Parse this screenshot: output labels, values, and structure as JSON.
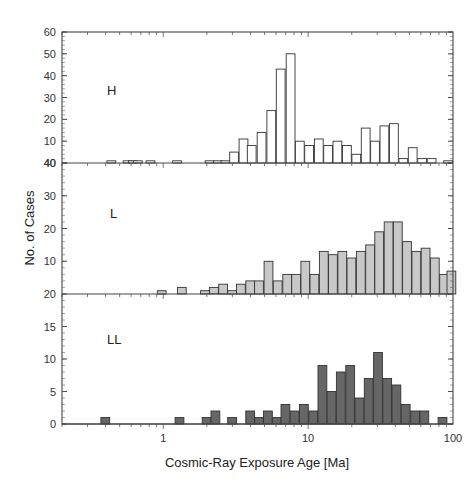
{
  "chart_data": {
    "type": "bar",
    "title": "",
    "xlabel": "Cosmic-Ray Exposure Age [Ma]",
    "ylabel": "No. of Cases",
    "xscale": "log",
    "xlim": [
      0.2,
      100
    ],
    "x_ticks": [
      {
        "value": 1,
        "label": "1"
      },
      {
        "value": 10,
        "label": "10"
      },
      {
        "value": 100,
        "label": "100"
      }
    ],
    "bin_width_log10": 0.065,
    "grid": false,
    "legend": null,
    "panels": [
      {
        "name": "H",
        "label": "H",
        "fill": "#ffffff",
        "ylim": [
          0,
          60
        ],
        "y_ticks": [
          {
            "value": 0,
            "label": "40"
          },
          {
            "value": 10,
            "label": "10"
          },
          {
            "value": 20,
            "label": "20"
          },
          {
            "value": 30,
            "label": "30"
          },
          {
            "value": 40,
            "label": "40"
          },
          {
            "value": 50,
            "label": "50"
          },
          {
            "value": 60,
            "label": "60"
          }
        ],
        "bins": [
          {
            "x": 0.44,
            "count": 1
          },
          {
            "x": 0.57,
            "count": 1
          },
          {
            "x": 0.62,
            "count": 1
          },
          {
            "x": 0.67,
            "count": 1
          },
          {
            "x": 0.82,
            "count": 1
          },
          {
            "x": 1.25,
            "count": 1
          },
          {
            "x": 2.1,
            "count": 1
          },
          {
            "x": 2.4,
            "count": 1
          },
          {
            "x": 2.7,
            "count": 1
          },
          {
            "x": 3.1,
            "count": 5
          },
          {
            "x": 3.6,
            "count": 11
          },
          {
            "x": 4.1,
            "count": 8
          },
          {
            "x": 4.8,
            "count": 14
          },
          {
            "x": 5.6,
            "count": 24
          },
          {
            "x": 6.5,
            "count": 43
          },
          {
            "x": 7.6,
            "count": 50
          },
          {
            "x": 8.8,
            "count": 10
          },
          {
            "x": 10.2,
            "count": 8
          },
          {
            "x": 11.9,
            "count": 11
          },
          {
            "x": 13.8,
            "count": 8
          },
          {
            "x": 16.0,
            "count": 10
          },
          {
            "x": 18.6,
            "count": 8
          },
          {
            "x": 21.6,
            "count": 4
          },
          {
            "x": 25.1,
            "count": 16
          },
          {
            "x": 29.1,
            "count": 10
          },
          {
            "x": 33.8,
            "count": 17
          },
          {
            "x": 39.3,
            "count": 18
          },
          {
            "x": 45.6,
            "count": 2
          },
          {
            "x": 53.0,
            "count": 7
          },
          {
            "x": 61.5,
            "count": 2
          },
          {
            "x": 71.5,
            "count": 2
          },
          {
            "x": 93.0,
            "count": 1
          }
        ]
      },
      {
        "name": "L",
        "label": "L",
        "fill": "#c8c8c8",
        "ylim": [
          0,
          40
        ],
        "y_ticks": [
          {
            "value": 0,
            "label": "20"
          },
          {
            "value": 10,
            "label": "10"
          },
          {
            "value": 20,
            "label": "20"
          },
          {
            "value": 30,
            "label": "30"
          },
          {
            "value": 40,
            "label": "40"
          }
        ],
        "bins": [
          {
            "x": 0.98,
            "count": 1
          },
          {
            "x": 1.35,
            "count": 2
          },
          {
            "x": 1.95,
            "count": 1
          },
          {
            "x": 2.25,
            "count": 2
          },
          {
            "x": 2.6,
            "count": 3
          },
          {
            "x": 3.0,
            "count": 1
          },
          {
            "x": 3.45,
            "count": 3
          },
          {
            "x": 4.0,
            "count": 4
          },
          {
            "x": 4.6,
            "count": 4
          },
          {
            "x": 5.35,
            "count": 10
          },
          {
            "x": 6.2,
            "count": 4
          },
          {
            "x": 7.2,
            "count": 6
          },
          {
            "x": 8.3,
            "count": 6
          },
          {
            "x": 9.6,
            "count": 10
          },
          {
            "x": 11.1,
            "count": 6
          },
          {
            "x": 12.9,
            "count": 13
          },
          {
            "x": 14.9,
            "count": 12
          },
          {
            "x": 17.3,
            "count": 13
          },
          {
            "x": 20.0,
            "count": 11
          },
          {
            "x": 23.2,
            "count": 13
          },
          {
            "x": 26.9,
            "count": 15
          },
          {
            "x": 31.1,
            "count": 19
          },
          {
            "x": 36.1,
            "count": 22
          },
          {
            "x": 41.8,
            "count": 22
          },
          {
            "x": 48.4,
            "count": 16
          },
          {
            "x": 56.1,
            "count": 13
          },
          {
            "x": 65.0,
            "count": 14
          },
          {
            "x": 75.3,
            "count": 11
          },
          {
            "x": 87.3,
            "count": 6
          },
          {
            "x": 98.0,
            "count": 7
          }
        ]
      },
      {
        "name": "LL",
        "label": "LL",
        "fill": "#666666",
        "ylim": [
          0,
          20
        ],
        "y_ticks": [
          {
            "value": 0,
            "label": "0"
          },
          {
            "value": 5,
            "label": "5"
          },
          {
            "value": 10,
            "label": "10"
          },
          {
            "value": 15,
            "label": "15"
          }
        ],
        "bins": [
          {
            "x": 0.4,
            "count": 1
          },
          {
            "x": 1.3,
            "count": 1
          },
          {
            "x": 2.0,
            "count": 1
          },
          {
            "x": 2.3,
            "count": 2
          },
          {
            "x": 3.0,
            "count": 1
          },
          {
            "x": 4.0,
            "count": 2
          },
          {
            "x": 4.6,
            "count": 1
          },
          {
            "x": 5.3,
            "count": 2
          },
          {
            "x": 6.1,
            "count": 1
          },
          {
            "x": 7.0,
            "count": 3
          },
          {
            "x": 8.1,
            "count": 2
          },
          {
            "x": 9.4,
            "count": 3
          },
          {
            "x": 10.9,
            "count": 2
          },
          {
            "x": 12.6,
            "count": 9
          },
          {
            "x": 14.6,
            "count": 5
          },
          {
            "x": 16.9,
            "count": 8
          },
          {
            "x": 19.6,
            "count": 9
          },
          {
            "x": 22.7,
            "count": 4
          },
          {
            "x": 26.3,
            "count": 7
          },
          {
            "x": 30.5,
            "count": 11
          },
          {
            "x": 35.3,
            "count": 7
          },
          {
            "x": 40.9,
            "count": 6
          },
          {
            "x": 47.4,
            "count": 3
          },
          {
            "x": 55.0,
            "count": 2
          },
          {
            "x": 63.7,
            "count": 2
          },
          {
            "x": 85.0,
            "count": 1
          }
        ]
      }
    ]
  },
  "labels": {
    "xlabel": "Cosmic-Ray Exposure Age [Ma]",
    "ylabel": "No. of Cases",
    "panel_h": "H",
    "panel_l": "L",
    "panel_ll": "LL"
  }
}
